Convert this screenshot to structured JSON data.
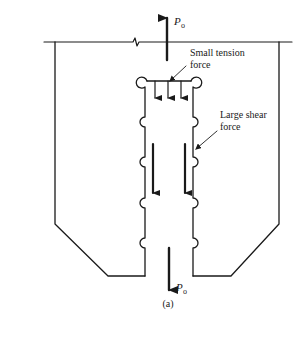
{
  "figure": {
    "caption": "(a)",
    "load_top": {
      "symbol": "P",
      "subscript": "o",
      "direction": "up"
    },
    "load_bottom": {
      "symbol": "P",
      "subscript": "o",
      "direction": "down"
    },
    "annotations": {
      "tension": {
        "line1": "Small tension",
        "line2": "force"
      },
      "shear": {
        "line1": "Large shear",
        "line2": "force"
      }
    },
    "tension_arrows_count": 3,
    "shear_arrows_count": 2,
    "colors": {
      "ink": "#1a1a1a",
      "background": "#ffffff"
    }
  }
}
